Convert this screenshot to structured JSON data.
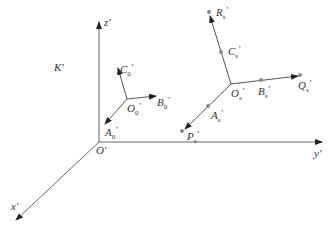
{
  "diagram": {
    "frame_label": "K'",
    "origin_label": "O'",
    "axes": {
      "x": "x'",
      "y": "y'",
      "z": "z'"
    },
    "frame0": {
      "origin": {
        "base": "O",
        "sub": "0",
        "prime": "'"
      },
      "A": {
        "base": "A",
        "sub": "0",
        "prime": "'"
      },
      "B": {
        "base": "B",
        "sub": "0",
        "prime": "'"
      },
      "C": {
        "base": "C",
        "sub": "0",
        "prime": "'"
      }
    },
    "frameS": {
      "origin": {
        "base": "O",
        "sub": "s",
        "prime": "'"
      },
      "A": {
        "base": "A",
        "sub": "s",
        "prime": "'"
      },
      "B": {
        "base": "B",
        "sub": "s",
        "prime": "'"
      },
      "C": {
        "base": "C",
        "sub": "s",
        "prime": "'"
      },
      "P": {
        "base": "P",
        "sub": "s",
        "prime": "'"
      },
      "Q": {
        "base": "Q",
        "sub": "s",
        "prime": "'"
      },
      "R": {
        "base": "R",
        "sub": "s",
        "prime": "'"
      }
    },
    "colors": {
      "line": "#555555",
      "point": "#888888",
      "text": "#333333"
    }
  }
}
